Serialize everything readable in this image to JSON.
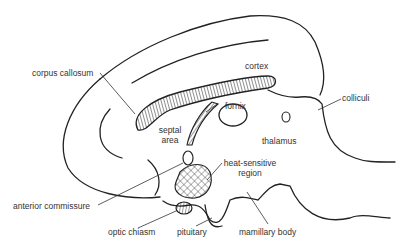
{
  "diagram": {
    "labels": {
      "corpus_callosum": "corpus callosum",
      "cortex": "cortex",
      "fornix": "fornix",
      "colliculi": "colliculi",
      "septal_area_line1": "septal",
      "septal_area_line2": "area",
      "thalamus": "thalamus",
      "heat_sensitive_line1": "heat-sensitive",
      "heat_sensitive_line2": "region",
      "anterior_commissure": "anterior commissure",
      "optic_chiasm": "optic chiasm",
      "pituitary": "pituitary",
      "mamillary_body": "mamillary body"
    },
    "colors": {
      "line": "#222222",
      "text": "#333333",
      "background": "#ffffff"
    }
  }
}
